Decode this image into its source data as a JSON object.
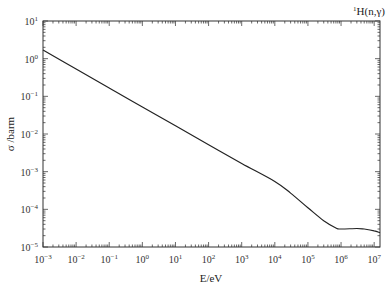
{
  "chart_data": {
    "type": "line",
    "title": "",
    "annotation": "1H(n,γ)",
    "annotation_parts": {
      "superscript": "1",
      "text": "H(n,γ)"
    },
    "xlabel": "E/eV",
    "ylabel": "σ /barm",
    "xscale": "log",
    "yscale": "log",
    "xlim": [
      0.001,
      15000000
    ],
    "ylim": [
      1e-05,
      10
    ],
    "grid": false,
    "legend": null,
    "x_ticks": [
      {
        "base": "10",
        "exp": "-3"
      },
      {
        "base": "10",
        "exp": "-2"
      },
      {
        "base": "10",
        "exp": "-1"
      },
      {
        "base": "10",
        "exp": "0"
      },
      {
        "base": "10",
        "exp": "1"
      },
      {
        "base": "10",
        "exp": "2"
      },
      {
        "base": "10",
        "exp": "3"
      },
      {
        "base": "10",
        "exp": "4"
      },
      {
        "base": "10",
        "exp": "5"
      },
      {
        "base": "10",
        "exp": "6"
      },
      {
        "base": "10",
        "exp": "7"
      }
    ],
    "y_ticks": [
      {
        "base": "10",
        "exp": "1"
      },
      {
        "base": "10",
        "exp": "0"
      },
      {
        "base": "10",
        "exp": "-1"
      },
      {
        "base": "10",
        "exp": "-2"
      },
      {
        "base": "10",
        "exp": "-3"
      },
      {
        "base": "10",
        "exp": "-4"
      },
      {
        "base": "10",
        "exp": "-5"
      }
    ],
    "series": [
      {
        "name": "1H(n,γ)",
        "color": "#222222",
        "x": [
          0.001,
          0.01,
          0.1,
          1,
          10,
          100,
          1000,
          10000,
          30000,
          100000,
          300000,
          700000,
          1000000,
          3000000,
          5000000,
          10000000,
          15000000
        ],
        "y": [
          1.7,
          0.53,
          0.166,
          0.052,
          0.0166,
          0.0052,
          0.00166,
          0.00055,
          0.00027,
          0.00011,
          5e-05,
          3.2e-05,
          3e-05,
          3.1e-05,
          3e-05,
          2.7e-05,
          2.4e-05
        ]
      }
    ]
  }
}
